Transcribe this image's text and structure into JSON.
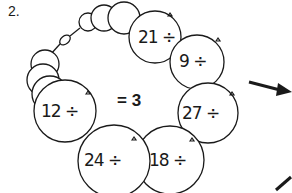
{
  "problem_number": "2.",
  "answer_text": "= 3",
  "beads": [
    {
      "label": "21 ÷"
    },
    {
      "label": "9 ÷"
    },
    {
      "label": "27 ÷"
    },
    {
      "label": "18 ÷"
    },
    {
      "label": "24 ÷"
    },
    {
      "label": "12 ÷"
    }
  ],
  "colors": {
    "stroke": "#1a1a1a",
    "background": "#ffffff"
  }
}
